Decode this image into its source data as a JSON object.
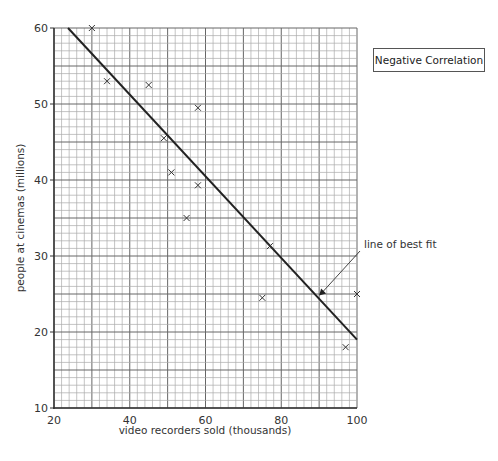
{
  "chart_data": {
    "type": "scatter",
    "title": "",
    "xlabel": "video recorders sold (thousands)",
    "ylabel": "people at cinemas (millions)",
    "xlim": [
      20,
      100
    ],
    "ylim": [
      10,
      60
    ],
    "xticks": [
      20,
      40,
      60,
      80,
      100
    ],
    "yticks": [
      10,
      20,
      30,
      40,
      50,
      60
    ],
    "grid": true,
    "points": [
      {
        "x": 30,
        "y": 60
      },
      {
        "x": 34,
        "y": 53
      },
      {
        "x": 45,
        "y": 52.5
      },
      {
        "x": 58,
        "y": 49.5
      },
      {
        "x": 49,
        "y": 45.5
      },
      {
        "x": 51,
        "y": 41
      },
      {
        "x": 58,
        "y": 39.3
      },
      {
        "x": 55,
        "y": 35
      },
      {
        "x": 77,
        "y": 31.3
      },
      {
        "x": 75,
        "y": 24.5
      },
      {
        "x": 100,
        "y": 25
      },
      {
        "x": 97,
        "y": 18
      }
    ],
    "line_of_best_fit": {
      "x1": 23.7,
      "y1": 60,
      "x2": 100,
      "y2": 19
    },
    "legend": "Negative Correlation",
    "annotations": [
      {
        "text": "line of best fit",
        "arrow_to": {
          "x": 90,
          "y": 24.8
        }
      }
    ]
  },
  "legend_label": "Negative Correlation",
  "annotation_label": "line of best fit"
}
